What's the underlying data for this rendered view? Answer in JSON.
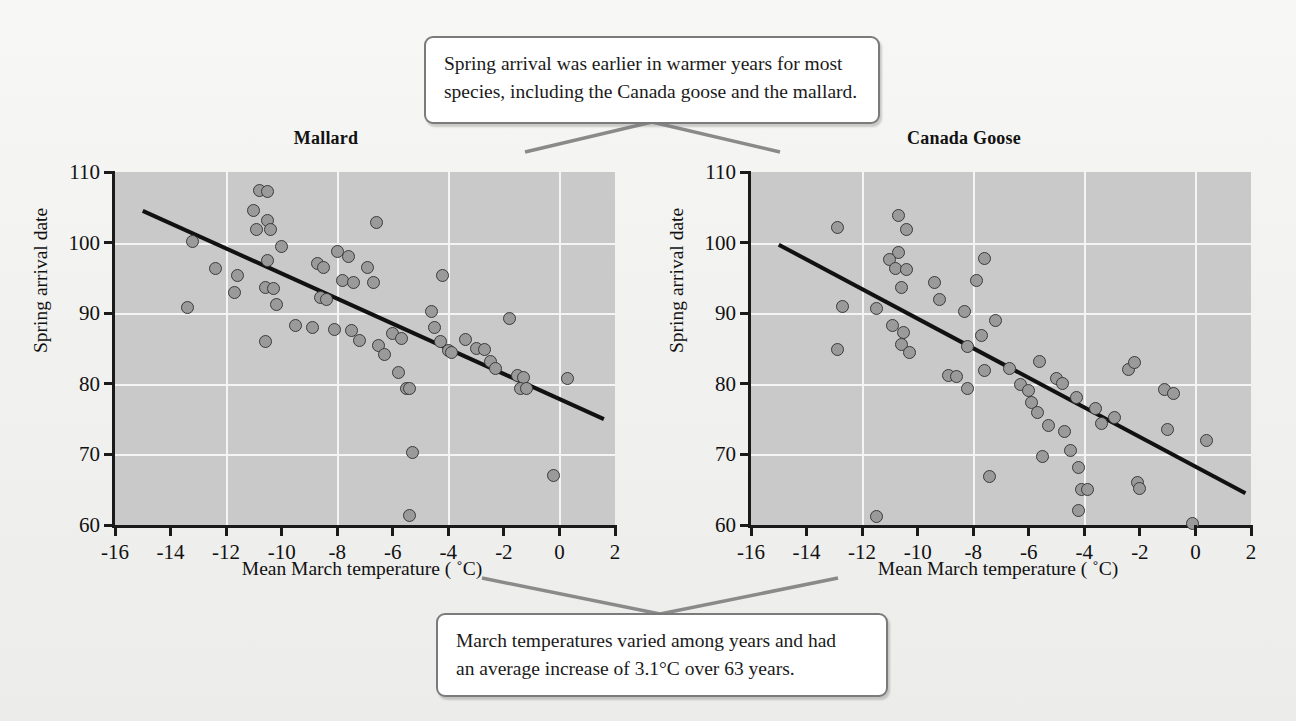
{
  "figure": {
    "background_color": "#f2f2f0",
    "plot_background_color": "#c9c9c9",
    "gridline_color": "#f4f4f4",
    "point_fill_color": "#9a9a9a",
    "point_edge_color": "#3a3a3a",
    "trendline_color": "#111111",
    "callout_border_color": "#7b7b7b"
  },
  "callouts": {
    "top": {
      "line1": "Spring arrival was earlier in warmer years for most",
      "line2": "species, including the Canada goose and the mallard."
    },
    "bottom": {
      "line1": "March temperatures varied among years and had",
      "line2": "an average increase of 3.1°C over 63 years."
    }
  },
  "chart_data": [
    {
      "type": "scatter",
      "title": "Mallard",
      "xlabel": "Mean March temperature ( ˚C)",
      "ylabel": "Spring arrival date",
      "xlim": [
        -16,
        2
      ],
      "ylim": [
        60,
        110
      ],
      "xticks": [
        -16,
        -14,
        -12,
        -10,
        -8,
        -6,
        -4,
        -2,
        0,
        2
      ],
      "xtick_labels": [
        "-16",
        "-14",
        "-12",
        "-10",
        "-8",
        "-6",
        "-4",
        "-2",
        "0",
        "2"
      ],
      "yticks": [
        60,
        70,
        80,
        90,
        100,
        110
      ],
      "ytick_labels": [
        "60",
        "70",
        "80",
        "90",
        "100",
        "110"
      ],
      "grid": true,
      "gridlines_x": [
        -12,
        -8,
        -4,
        0
      ],
      "gridlines_y": [
        70,
        80,
        90,
        100
      ],
      "trendline": {
        "x1": -15.0,
        "y1": 104.5,
        "x2": 1.6,
        "y2": 75.0
      },
      "points": [
        {
          "x": -13.2,
          "y": 100.2
        },
        {
          "x": -13.4,
          "y": 90.8
        },
        {
          "x": -12.4,
          "y": 96.4
        },
        {
          "x": -11.6,
          "y": 95.3
        },
        {
          "x": -11.7,
          "y": 92.9
        },
        {
          "x": -10.8,
          "y": 107.4
        },
        {
          "x": -10.5,
          "y": 107.2
        },
        {
          "x": -11.0,
          "y": 104.6
        },
        {
          "x": -10.5,
          "y": 103.1
        },
        {
          "x": -10.9,
          "y": 101.9
        },
        {
          "x": -10.4,
          "y": 101.8
        },
        {
          "x": -10.5,
          "y": 97.5
        },
        {
          "x": -10.6,
          "y": 93.7
        },
        {
          "x": -10.3,
          "y": 93.5
        },
        {
          "x": -10.0,
          "y": 99.4
        },
        {
          "x": -10.2,
          "y": 91.3
        },
        {
          "x": -10.6,
          "y": 86.0
        },
        {
          "x": -9.5,
          "y": 88.3
        },
        {
          "x": -8.9,
          "y": 88.0
        },
        {
          "x": -8.7,
          "y": 97.0
        },
        {
          "x": -8.5,
          "y": 96.5
        },
        {
          "x": -8.6,
          "y": 92.2
        },
        {
          "x": -8.4,
          "y": 91.9
        },
        {
          "x": -8.1,
          "y": 87.7
        },
        {
          "x": -8.0,
          "y": 98.7
        },
        {
          "x": -7.6,
          "y": 98.0
        },
        {
          "x": -7.8,
          "y": 94.7
        },
        {
          "x": -7.4,
          "y": 94.4
        },
        {
          "x": -7.5,
          "y": 87.6
        },
        {
          "x": -7.2,
          "y": 86.2
        },
        {
          "x": -6.9,
          "y": 96.5
        },
        {
          "x": -6.6,
          "y": 102.8
        },
        {
          "x": -6.7,
          "y": 94.4
        },
        {
          "x": -6.5,
          "y": 85.4
        },
        {
          "x": -6.3,
          "y": 84.1
        },
        {
          "x": -6.0,
          "y": 87.1
        },
        {
          "x": -5.7,
          "y": 86.4
        },
        {
          "x": -5.8,
          "y": 81.6
        },
        {
          "x": -5.5,
          "y": 79.4
        },
        {
          "x": -5.4,
          "y": 79.4
        },
        {
          "x": -5.3,
          "y": 70.3
        },
        {
          "x": -5.4,
          "y": 61.3
        },
        {
          "x": -4.6,
          "y": 90.2
        },
        {
          "x": -4.5,
          "y": 88.0
        },
        {
          "x": -4.2,
          "y": 95.4
        },
        {
          "x": -4.3,
          "y": 86.0
        },
        {
          "x": -4.0,
          "y": 84.7
        },
        {
          "x": -3.9,
          "y": 84.5
        },
        {
          "x": -3.4,
          "y": 86.3
        },
        {
          "x": -3.0,
          "y": 85.0
        },
        {
          "x": -2.7,
          "y": 84.9
        },
        {
          "x": -2.5,
          "y": 83.1
        },
        {
          "x": -2.3,
          "y": 82.1
        },
        {
          "x": -1.8,
          "y": 89.3
        },
        {
          "x": -1.5,
          "y": 81.2
        },
        {
          "x": -1.3,
          "y": 80.9
        },
        {
          "x": -1.4,
          "y": 79.4
        },
        {
          "x": -1.2,
          "y": 79.4
        },
        {
          "x": -0.2,
          "y": 67.0
        },
        {
          "x": 0.3,
          "y": 80.8
        }
      ]
    },
    {
      "type": "scatter",
      "title": "Canada Goose",
      "xlabel": "Mean March temperature ( ˚C)",
      "ylabel": "Spring arrival date",
      "xlim": [
        -16,
        2
      ],
      "ylim": [
        60,
        110
      ],
      "xticks": [
        -16,
        -14,
        -12,
        -10,
        -8,
        -6,
        -4,
        -2,
        0,
        2
      ],
      "xtick_labels": [
        "-16",
        "-14",
        "-12",
        "-10",
        "-8",
        "-6",
        "-4",
        "-2",
        "0",
        "2"
      ],
      "yticks": [
        60,
        70,
        80,
        90,
        100,
        110
      ],
      "ytick_labels": [
        "60",
        "70",
        "80",
        "90",
        "100",
        "110"
      ],
      "grid": true,
      "gridlines_x": [
        -12,
        -8,
        -4,
        0
      ],
      "gridlines_y": [
        70,
        80,
        90,
        100
      ],
      "trendline": {
        "x1": -15.0,
        "y1": 99.7,
        "x2": 1.8,
        "y2": 64.5
      },
      "points": [
        {
          "x": -12.9,
          "y": 102.2
        },
        {
          "x": -12.7,
          "y": 90.9
        },
        {
          "x": -12.9,
          "y": 84.8
        },
        {
          "x": -11.5,
          "y": 61.2
        },
        {
          "x": -10.7,
          "y": 103.9
        },
        {
          "x": -10.4,
          "y": 101.9
        },
        {
          "x": -10.7,
          "y": 98.6
        },
        {
          "x": -11.0,
          "y": 97.6
        },
        {
          "x": -10.8,
          "y": 96.3
        },
        {
          "x": -10.4,
          "y": 96.2
        },
        {
          "x": -10.6,
          "y": 93.7
        },
        {
          "x": -10.9,
          "y": 88.3
        },
        {
          "x": -10.5,
          "y": 87.2
        },
        {
          "x": -10.6,
          "y": 85.5
        },
        {
          "x": -10.3,
          "y": 84.4
        },
        {
          "x": -11.5,
          "y": 90.7
        },
        {
          "x": -9.4,
          "y": 94.3
        },
        {
          "x": -9.2,
          "y": 92.0
        },
        {
          "x": -8.9,
          "y": 81.2
        },
        {
          "x": -8.6,
          "y": 81.1
        },
        {
          "x": -8.3,
          "y": 90.2
        },
        {
          "x": -8.2,
          "y": 85.3
        },
        {
          "x": -8.2,
          "y": 79.3
        },
        {
          "x": -7.9,
          "y": 94.6
        },
        {
          "x": -7.6,
          "y": 97.8
        },
        {
          "x": -7.7,
          "y": 86.8
        },
        {
          "x": -7.6,
          "y": 81.9
        },
        {
          "x": -7.4,
          "y": 66.8
        },
        {
          "x": -7.2,
          "y": 89.0
        },
        {
          "x": -6.7,
          "y": 82.1
        },
        {
          "x": -6.3,
          "y": 79.9
        },
        {
          "x": -6.0,
          "y": 79.1
        },
        {
          "x": -5.9,
          "y": 77.3
        },
        {
          "x": -5.6,
          "y": 83.2
        },
        {
          "x": -5.7,
          "y": 75.9
        },
        {
          "x": -5.5,
          "y": 69.7
        },
        {
          "x": -5.3,
          "y": 74.1
        },
        {
          "x": -5.0,
          "y": 80.8
        },
        {
          "x": -4.8,
          "y": 80.1
        },
        {
          "x": -4.7,
          "y": 73.3
        },
        {
          "x": -4.5,
          "y": 70.6
        },
        {
          "x": -4.3,
          "y": 78.0
        },
        {
          "x": -4.2,
          "y": 68.2
        },
        {
          "x": -4.1,
          "y": 65.0
        },
        {
          "x": -3.9,
          "y": 65.0
        },
        {
          "x": -4.2,
          "y": 62.1
        },
        {
          "x": -3.6,
          "y": 76.5
        },
        {
          "x": -3.4,
          "y": 74.4
        },
        {
          "x": -2.9,
          "y": 75.2
        },
        {
          "x": -2.4,
          "y": 82.0
        },
        {
          "x": -2.2,
          "y": 83.0
        },
        {
          "x": -2.1,
          "y": 66.0
        },
        {
          "x": -2.0,
          "y": 65.2
        },
        {
          "x": -1.1,
          "y": 79.2
        },
        {
          "x": -0.8,
          "y": 78.6
        },
        {
          "x": -1.0,
          "y": 73.5
        },
        {
          "x": -0.1,
          "y": 60.2
        },
        {
          "x": 0.4,
          "y": 71.9
        }
      ]
    }
  ]
}
